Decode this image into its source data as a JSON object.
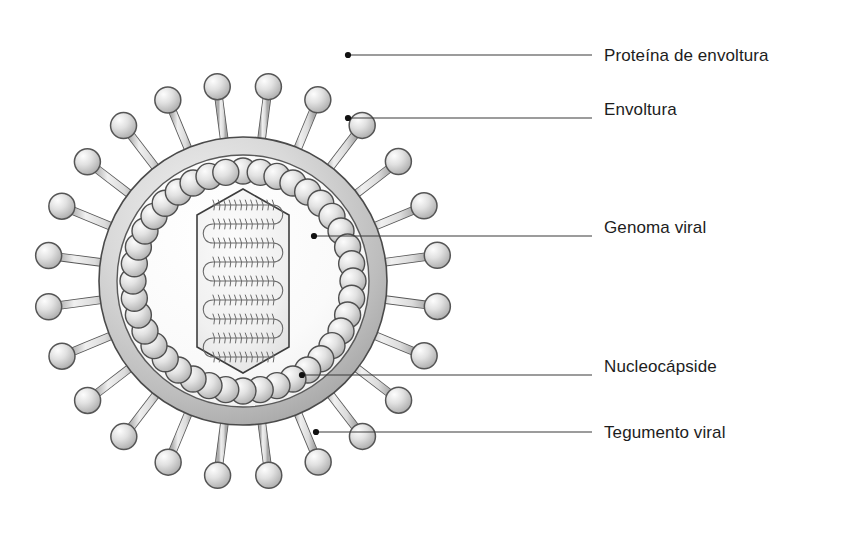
{
  "figure": {
    "kind": "virus-structure-diagram",
    "language": "es",
    "background_color": "#ffffff",
    "ink_color": "#1d1d1d",
    "leader_line_color": "#3a3a3a"
  },
  "labels": [
    {
      "id": "envelope-protein",
      "text": "Proteína de envoltura",
      "x": 604,
      "y": 47,
      "leader": {
        "dot_x": 348,
        "dot_y": 55,
        "to_x": 592,
        "to_y": 55
      }
    },
    {
      "id": "envelope",
      "text": "Envoltura",
      "x": 604,
      "y": 101,
      "leader": {
        "dot_x": 348,
        "dot_y": 118,
        "to_x": 592,
        "to_y": 118
      }
    },
    {
      "id": "viral-genome",
      "text": "Genoma viral",
      "x": 604,
      "y": 219,
      "leader": {
        "dot_x": 314,
        "dot_y": 236,
        "to_x": 592,
        "to_y": 236
      }
    },
    {
      "id": "nucleocapsid",
      "text": "Nucleocápside",
      "x": 604,
      "y": 358,
      "leader": {
        "dot_x": 302,
        "dot_y": 375,
        "to_x": 592,
        "to_y": 375
      }
    },
    {
      "id": "viral-tegument",
      "text": "Tegumento viral",
      "x": 604,
      "y": 424,
      "leader": {
        "dot_x": 316,
        "dot_y": 432,
        "to_x": 592,
        "to_y": 432
      }
    }
  ],
  "structure": {
    "center_x": 243,
    "center_y": 281,
    "envelope": {
      "outer_radius": 144,
      "inner_radius": 126,
      "band_fill": "#c9c9c9",
      "outline": "#4a4a4a"
    },
    "interior": {
      "radius": 126,
      "fill": "#fafafa"
    },
    "spikes": {
      "count": 24,
      "stalk_length": 42,
      "stalk_width": 7,
      "head_radius": 13,
      "fill": "#d2d2d2",
      "outline": "#555555"
    },
    "tegument": {
      "count": 40,
      "ring_radius": 110,
      "bead_radius": 13,
      "fill": "#d8d8d8",
      "outline": "#4f4f4f"
    },
    "nucleocapsid": {
      "shape": "elongated-hexagon",
      "half_width": 46,
      "half_height": 92,
      "corner_inset": 26,
      "fill": "#f2f2f2",
      "outline": "#3d3d3d"
    },
    "genome": {
      "description": "coiled double-stranded DNA packed in serpentine loops",
      "passes": 9,
      "coil_color": "#6b6b6b"
    }
  }
}
